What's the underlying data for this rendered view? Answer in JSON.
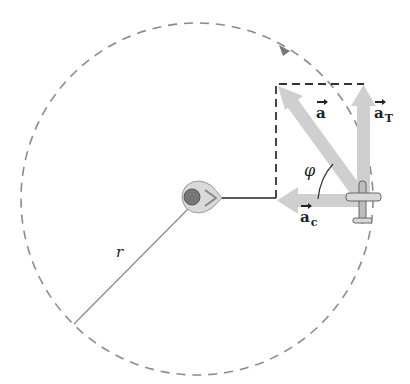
{
  "figure": {
    "labels": {
      "a": "a",
      "aT_base": "a",
      "aT_sub": "T",
      "ac_base": "a",
      "ac_sub": "c",
      "phi": "φ",
      "r": "r"
    },
    "colors": {
      "circle": "#8a8a8a",
      "arrow_fill": "#cfcfcf",
      "dashed_rect": "#333333",
      "radius_line": "#888888",
      "text": "#222222"
    },
    "geometry": {
      "circle_center": [
        197,
        199
      ],
      "circle_radius": 176,
      "airplane_position": [
        362,
        200
      ],
      "dashed_rect": {
        "x": 276,
        "y": 84,
        "w": 88,
        "h": 114
      },
      "phi_description": "angle between a and a_c"
    }
  }
}
